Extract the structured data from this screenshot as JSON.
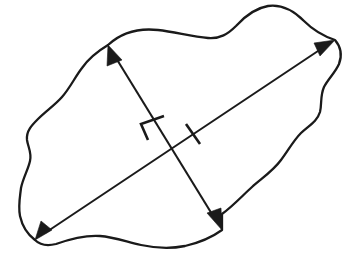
{
  "figure": {
    "title": "Irregular closed shape with two crossing dimension arrows",
    "background_color": "#ffffff",
    "ink_color": "#1a1a1a",
    "width": 350,
    "height": 261,
    "shape": {
      "name": "irregular-blob-outline",
      "style": "hand-drawn closed freeform curve",
      "stroke_width": 2.3,
      "fill": "none"
    },
    "dimensions": [
      {
        "name": "major-axis-arrow",
        "description": "long double-headed arrow from lower-left to upper-right",
        "start": [
          35,
          240
        ],
        "end": [
          335,
          40
        ],
        "arrowheads": "both",
        "label": ""
      },
      {
        "name": "minor-axis-arrow",
        "description": "short double-headed arrow from upper-left to lower-right",
        "start": [
          108,
          45
        ],
        "end": [
          222,
          230
        ],
        "arrowheads": "both",
        "label": ""
      }
    ],
    "tick_marks": [
      {
        "name": "bracket-tick-minor-axis",
        "description": "bracket shaped hash mark on the minor axis above the crossing",
        "position": [
          152,
          123
        ]
      },
      {
        "name": "perpendicular-tick-major-axis",
        "description": "single perpendicular hash mark on the major axis right of the crossing",
        "position": [
          193,
          133
        ]
      }
    ],
    "crossing_point": [
      175,
      152
    ]
  }
}
